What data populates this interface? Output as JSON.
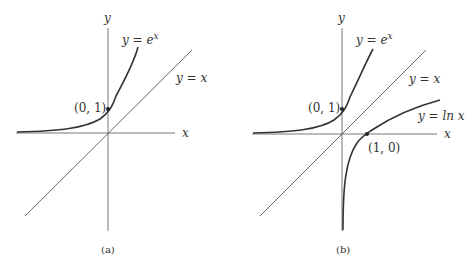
{
  "panels": [
    {
      "id": "a",
      "caption": "(a)",
      "axis_x": "x",
      "axis_y": "y",
      "curves": [
        {
          "label": "y = e",
          "sup": "x",
          "name": "exp"
        },
        {
          "label": "y = x",
          "name": "identity"
        }
      ],
      "points": [
        {
          "label": "(0, 1)"
        }
      ]
    },
    {
      "id": "b",
      "caption": "(b)",
      "axis_x": "x",
      "axis_y": "y",
      "curves": [
        {
          "label": "y = e",
          "sup": "x",
          "name": "exp"
        },
        {
          "label": "y = x",
          "name": "identity"
        },
        {
          "label": "y = ln x",
          "name": "log"
        }
      ],
      "points": [
        {
          "label": "(0, 1)"
        },
        {
          "label": "(1, 0)"
        }
      ]
    }
  ],
  "colors": {
    "curve": "#333333",
    "axis": "#555555",
    "point": "#222222"
  }
}
